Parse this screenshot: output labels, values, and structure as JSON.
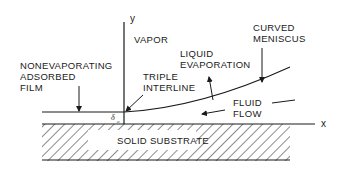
{
  "diagram": {
    "axes": {
      "y_label": "y",
      "x_label": "x"
    },
    "labels": {
      "vapor": "VAPOR",
      "nonevap_line1": "NONEVAPORATING",
      "nonevap_line2": "ADSORBED",
      "nonevap_line3": "FILM",
      "triple_line1": "TRIPLE",
      "triple_line2": "INTERLINE",
      "liquid_line1": "LIQUID",
      "liquid_line2": "EVAPORATION",
      "curved_line1": "CURVED",
      "curved_line2": "MENISCUS",
      "fluid_line1": "FLUID",
      "fluid_line2": "FLOW",
      "substrate": "SOLID SUBSTRATE",
      "delta": "δ",
      "delta_sub": "o"
    },
    "colors": {
      "ink": "#1a1a1a",
      "background": "#ffffff"
    }
  }
}
